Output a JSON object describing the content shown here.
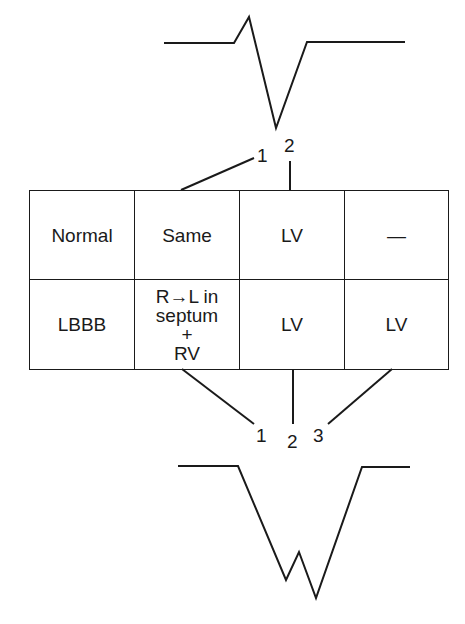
{
  "top_waveform": {
    "name": "normal-qrs-complex",
    "points": [
      [
        164,
        43
      ],
      [
        234,
        43
      ],
      [
        249,
        17
      ],
      [
        276,
        128
      ],
      [
        307,
        42
      ],
      [
        405,
        42
      ]
    ]
  },
  "top_leaders": [
    {
      "label": "1",
      "line": [
        181,
        190,
        254,
        158
      ],
      "pos": [
        257,
        146
      ]
    },
    {
      "label": "2",
      "line": [
        290,
        190,
        290,
        161
      ],
      "pos": [
        284,
        136
      ]
    }
  ],
  "table": {
    "rows": [
      {
        "cells": [
          "Normal",
          "Same",
          "LV",
          "—"
        ]
      },
      {
        "cells": [
          "LBBB",
          [
            "R→L in",
            "septum",
            "+",
            "RV"
          ],
          "LV",
          "LV"
        ]
      }
    ]
  },
  "bottom_leaders": [
    {
      "label": "1",
      "line": [
        182,
        369,
        254,
        424
      ],
      "pos": [
        256,
        426
      ]
    },
    {
      "label": "2",
      "line": [
        293,
        369,
        293,
        424
      ],
      "pos": [
        287,
        432
      ]
    },
    {
      "label": "3",
      "line": [
        392,
        369,
        328,
        424
      ],
      "pos": [
        313,
        426
      ]
    }
  ],
  "bottom_waveform": {
    "name": "lbbb-qrs-complex",
    "points": [
      [
        178,
        466
      ],
      [
        238,
        466
      ],
      [
        286,
        580
      ],
      [
        299,
        552
      ],
      [
        316,
        598
      ],
      [
        362,
        467
      ],
      [
        410,
        467
      ]
    ]
  },
  "colors": {
    "ink": "#1a1a1a",
    "background": "#ffffff"
  }
}
